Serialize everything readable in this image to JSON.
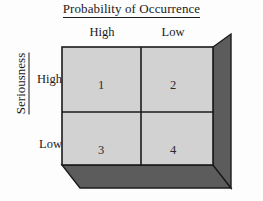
{
  "figure": {
    "type": "risk-matrix-2x2",
    "column_axis": {
      "title": "Probability of Occurrence",
      "underlined": true,
      "categories": [
        "High",
        "Low"
      ]
    },
    "row_axis": {
      "title": "Seriousness",
      "underlined": true,
      "orientation": "vertical",
      "categories": [
        "High",
        "Low"
      ]
    },
    "cells": [
      {
        "label": "1",
        "row": "High",
        "column": "High"
      },
      {
        "label": "2",
        "row": "High",
        "column": "Low"
      },
      {
        "label": "3",
        "row": "Low",
        "column": "High"
      },
      {
        "label": "4",
        "row": "Low",
        "column": "Low"
      }
    ],
    "colors": {
      "background": "#fdfdfd",
      "front_face": "#d2d2d2",
      "side_face": "#5c5c5c",
      "bottom_face": "#5c5c5c",
      "outline": "#1b1b1b",
      "text": "#1b1b1b"
    }
  }
}
